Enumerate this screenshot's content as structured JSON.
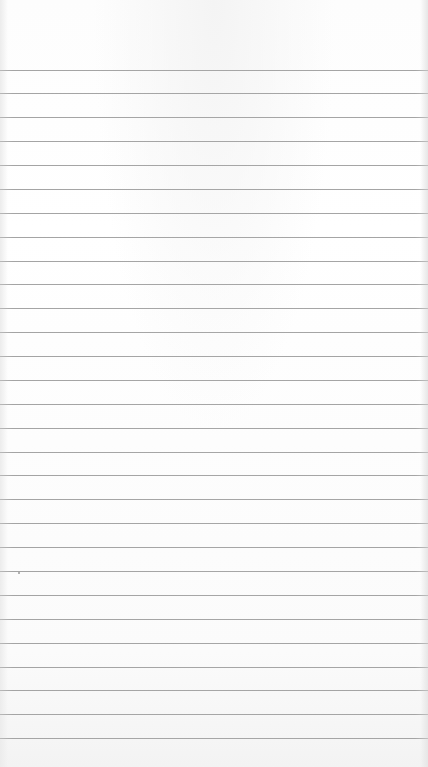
{
  "paper": {
    "type": "ruled-notebook-paper",
    "background_color": "#ffffff",
    "line_color": "#a6a6a6",
    "first_line_y": 69.5,
    "line_spacing": 23.88,
    "line_count": 29
  },
  "specks": [
    {
      "x": 18,
      "y": 572
    }
  ]
}
